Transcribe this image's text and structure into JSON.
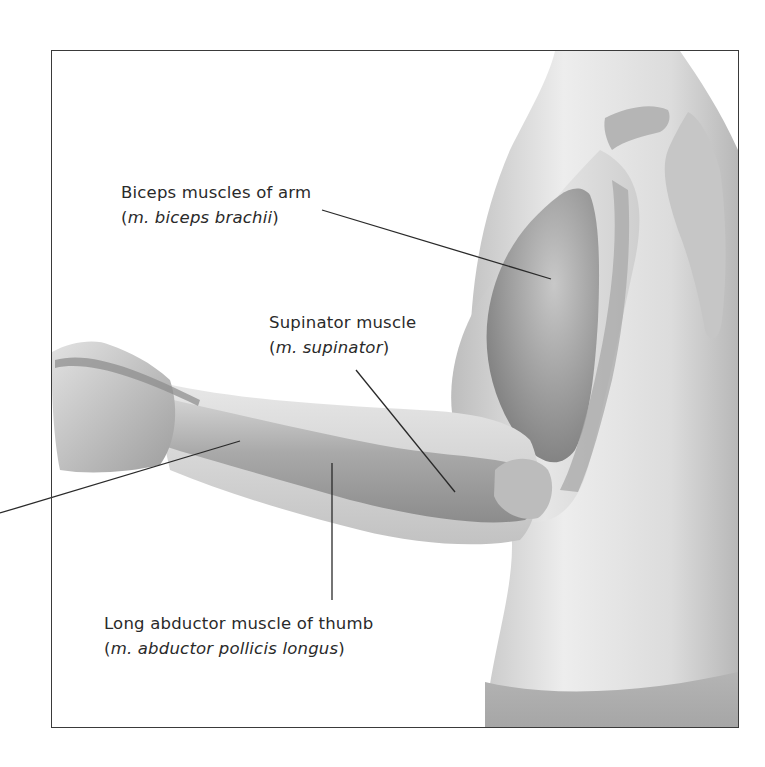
{
  "figure": {
    "colors": {
      "text": "#2a2a2a",
      "leader_line": "#2a2a2a",
      "frame_border": "#3a3a3a",
      "background": "#ffffff",
      "skin_light": "#ececec",
      "skin_mid": "#c9c9c9",
      "muscle_dark": "#9a9a9a"
    }
  },
  "labels": [
    {
      "id": "biceps",
      "common_name": "Biceps muscles of arm",
      "latin_open": "(",
      "latin_name": "m. biceps brachii",
      "latin_close": ")"
    },
    {
      "id": "supinator",
      "common_name": "Supinator muscle",
      "latin_open": "(",
      "latin_name": "m. supinator",
      "latin_close": ")"
    },
    {
      "id": "abductor",
      "common_name": "Long abductor muscle of thumb",
      "latin_open": "(",
      "latin_name": "m. abductor pollicis longus",
      "latin_close": ")"
    }
  ],
  "leader_lines": [
    {
      "id": "biceps-line",
      "x1": 322,
      "y1": 210,
      "x2": 551,
      "y2": 279
    },
    {
      "id": "supinator-line",
      "x1": 356,
      "y1": 370,
      "x2": 455,
      "y2": 492
    },
    {
      "id": "abductor-line",
      "x1": 332,
      "y1": 463,
      "x2": 332,
      "y2": 600
    },
    {
      "id": "unlabeled-forearm-line",
      "x1": 240,
      "y1": 441,
      "x2": 0,
      "y2": 513
    }
  ]
}
